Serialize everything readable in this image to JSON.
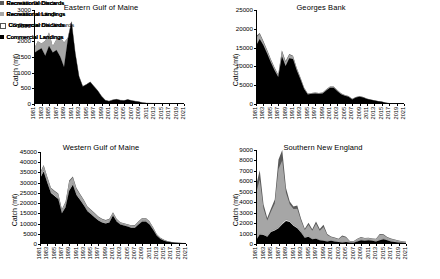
{
  "figure": {
    "ylabel": "Catch (mt)",
    "colors": {
      "recreational_discards": "#595959",
      "recreational_landings": "#a6a6a6",
      "commercial_discards": "#ffffff",
      "commercial_landings": "#000000"
    }
  },
  "chart_data": [
    {
      "id": "eastern-gulf-of-maine",
      "type": "area",
      "title": "Eastern Gulf of Maine",
      "xlabel": "",
      "ylabel": "Catch (mt)",
      "ylim": [
        0,
        3000
      ],
      "yticks": [
        0,
        500,
        1000,
        1500,
        2000,
        2500,
        3000
      ],
      "xlim": [
        1981,
        2021
      ],
      "xticks": [
        1981,
        1983,
        1985,
        1987,
        1989,
        1991,
        1993,
        1995,
        1997,
        1999,
        2001,
        2003,
        2005,
        2007,
        2009,
        2011,
        2013,
        2015,
        2017,
        2019,
        2021
      ],
      "grid": false,
      "legend_position": "right",
      "stacked": true,
      "x": [
        1981,
        1982,
        1983,
        1984,
        1985,
        1986,
        1987,
        1988,
        1989,
        1990,
        1991,
        1992,
        1993,
        1994,
        1995,
        1996,
        1997,
        1998,
        1999,
        2000,
        2001,
        2002,
        2003,
        2004,
        2005,
        2006,
        2007,
        2008,
        2009,
        2010,
        2011,
        2012,
        2013,
        2014,
        2015,
        2016,
        2017,
        2018,
        2019,
        2020,
        2021
      ],
      "series": [
        {
          "name": "Commercial Landings",
          "values": [
            1630,
            1710,
            1780,
            1540,
            1850,
            1640,
            1720,
            1510,
            1180,
            2050,
            2620,
            1620,
            880,
            560,
            620,
            700,
            560,
            420,
            250,
            120,
            90,
            130,
            150,
            120,
            110,
            140,
            110,
            90,
            70,
            40,
            30,
            25,
            20,
            18,
            15,
            12,
            10,
            8,
            6,
            5,
            4
          ]
        },
        {
          "name": "Commercial Discards",
          "values": [
            0,
            0,
            0,
            0,
            0,
            0,
            0,
            0,
            0,
            0,
            0,
            0,
            0,
            0,
            0,
            0,
            0,
            0,
            0,
            0,
            0,
            0,
            0,
            0,
            0,
            0,
            0,
            0,
            0,
            0,
            0,
            0,
            0,
            0,
            0,
            0,
            0,
            0,
            0,
            0,
            0
          ]
        },
        {
          "name": "Recreational Landings",
          "values": [
            130,
            290,
            150,
            480,
            430,
            200,
            350,
            630,
            780,
            60,
            20,
            15,
            10,
            10,
            10,
            10,
            10,
            8,
            6,
            5,
            5,
            5,
            5,
            5,
            5,
            5,
            5,
            5,
            5,
            4,
            3,
            3,
            2,
            2,
            2,
            2,
            2,
            2,
            2,
            2,
            2
          ]
        },
        {
          "name": "Recreational Discards",
          "values": [
            0,
            0,
            0,
            0,
            0,
            0,
            0,
            0,
            0,
            0,
            0,
            0,
            0,
            0,
            0,
            0,
            0,
            0,
            0,
            0,
            0,
            0,
            0,
            0,
            0,
            0,
            0,
            0,
            0,
            0,
            0,
            0,
            0,
            0,
            0,
            0,
            0,
            0,
            0,
            0,
            0
          ]
        }
      ],
      "legend": [
        "Recreational Discards",
        "Recreational Landings",
        "Commercial Discards",
        "Commercial Landings"
      ]
    },
    {
      "id": "georges-bank",
      "type": "area",
      "title": "Georges Bank",
      "xlabel": "",
      "ylabel": "Catch (mt)",
      "ylim": [
        0,
        25000
      ],
      "yticks": [
        0,
        5000,
        10000,
        15000,
        20000,
        25000
      ],
      "xlim": [
        1981,
        2021
      ],
      "xticks": [
        1981,
        1983,
        1985,
        1987,
        1989,
        1991,
        1993,
        1995,
        1997,
        1999,
        2001,
        2003,
        2005,
        2007,
        2009,
        2011,
        2013,
        2015,
        2017,
        2019,
        2021
      ],
      "grid": false,
      "legend_position": "right",
      "stacked": true,
      "x": [
        1981,
        1982,
        1983,
        1984,
        1985,
        1986,
        1987,
        1988,
        1989,
        1990,
        1991,
        1992,
        1993,
        1994,
        1995,
        1996,
        1997,
        1998,
        1999,
        2000,
        2001,
        2002,
        2003,
        2004,
        2005,
        2006,
        2007,
        2008,
        2009,
        2010,
        2011,
        2012,
        2013,
        2014,
        2015,
        2016,
        2017,
        2018,
        2019,
        2020,
        2021
      ],
      "series": [
        {
          "name": "US Commercial Discards",
          "values": [
            15500,
            17300,
            15600,
            13400,
            11100,
            9000,
            7200,
            12700,
            10100,
            12200,
            12000,
            9000,
            6600,
            4000,
            2500,
            2700,
            2800,
            2700,
            2800,
            3600,
            4300,
            4300,
            3400,
            2600,
            2200,
            1900,
            1200,
            1700,
            1900,
            1700,
            1300,
            1100,
            900,
            700,
            600,
            350,
            200,
            150,
            120,
            100,
            90
          ]
        },
        {
          "name": "Canadian Landings",
          "values": [
            2100,
            1300,
            900,
            800,
            700,
            600,
            500,
            1300,
            1100,
            900,
            700,
            500,
            400,
            300,
            250,
            200,
            200,
            200,
            200,
            250,
            300,
            300,
            250,
            200,
            180,
            160,
            140,
            150,
            160,
            150,
            120,
            100,
            80,
            70,
            60,
            40,
            30,
            25,
            20,
            15,
            12
          ]
        },
        {
          "name": "Canadian Discards",
          "values": [
            400,
            300,
            250,
            200,
            180,
            150,
            120,
            300,
            250,
            200,
            150,
            120,
            100,
            80,
            60,
            50,
            50,
            50,
            50,
            60,
            70,
            70,
            60,
            50,
            45,
            40,
            35,
            35,
            35,
            30,
            25,
            20,
            18,
            15,
            12,
            10,
            8,
            6,
            5,
            4,
            3
          ]
        }
      ],
      "legend": [
        "Canadian Discards",
        "Canadian Landings",
        "US Commercial Discards"
      ]
    },
    {
      "id": "western-gulf-of-maine",
      "type": "area",
      "title": "Western Gulf of Maine",
      "xlabel": "",
      "ylabel": "Catch (mt)",
      "ylim": [
        0,
        45000
      ],
      "yticks": [
        0,
        5000,
        10000,
        15000,
        20000,
        25000,
        30000,
        35000,
        40000,
        45000
      ],
      "xlim": [
        1981,
        2021
      ],
      "xticks": [
        1981,
        1983,
        1985,
        1987,
        1989,
        1991,
        1993,
        1995,
        1997,
        1999,
        2001,
        2003,
        2005,
        2007,
        2009,
        2011,
        2013,
        2015,
        2017,
        2019,
        2021
      ],
      "grid": false,
      "legend_position": "right",
      "stacked": true,
      "x": [
        1981,
        1982,
        1983,
        1984,
        1985,
        1986,
        1987,
        1988,
        1989,
        1990,
        1991,
        1992,
        1993,
        1994,
        1995,
        1996,
        1997,
        1998,
        1999,
        2000,
        2001,
        2002,
        2003,
        2004,
        2005,
        2006,
        2007,
        2008,
        2009,
        2010,
        2011,
        2012,
        2013,
        2014,
        2015,
        2016,
        2017,
        2018,
        2019,
        2020,
        2021
      ],
      "series": [
        {
          "name": "Commercial Landings",
          "values": [
            32000,
            35500,
            30000,
            25000,
            23500,
            22000,
            15000,
            18000,
            26000,
            29000,
            24000,
            21500,
            19000,
            16000,
            14500,
            13000,
            11500,
            10500,
            10000,
            10500,
            14000,
            11000,
            9500,
            9000,
            8500,
            8000,
            8000,
            9500,
            11000,
            11000,
            9500,
            7000,
            4000,
            2500,
            1600,
            1100,
            800,
            600,
            450,
            350,
            280
          ]
        },
        {
          "name": "Commercial Discards",
          "values": [
            500,
            600,
            500,
            450,
            400,
            400,
            300,
            350,
            450,
            500,
            450,
            400,
            350,
            300,
            300,
            280,
            250,
            230,
            220,
            230,
            300,
            250,
            220,
            200,
            200,
            190,
            190,
            220,
            250,
            250,
            220,
            180,
            120,
            90,
            70,
            50,
            40,
            30,
            25,
            20,
            15
          ]
        },
        {
          "name": "Recreational Landings",
          "values": [
            2000,
            2200,
            2000,
            1800,
            1800,
            2000,
            1500,
            2000,
            4000,
            3000,
            2500,
            2200,
            2000,
            1800,
            1700,
            1600,
            1500,
            1400,
            1300,
            1400,
            1000,
            900,
            800,
            800,
            800,
            800,
            900,
            1200,
            1300,
            1300,
            1200,
            900,
            600,
            400,
            300,
            200,
            150,
            120,
            90,
            70,
            55
          ]
        },
        {
          "name": "Recreational Discards",
          "values": [
            300,
            400,
            350,
            300,
            300,
            350,
            250,
            300,
            600,
            500,
            400,
            350,
            300,
            280,
            260,
            250,
            230,
            210,
            200,
            210,
            180,
            160,
            150,
            150,
            150,
            150,
            160,
            200,
            220,
            220,
            200,
            160,
            110,
            80,
            60,
            45,
            35,
            25,
            20,
            15,
            12
          ]
        }
      ],
      "legend": [
        "Recreational Discards",
        "Recreational Landings",
        "Commercial Discards",
        "Commercial Landings"
      ]
    },
    {
      "id": "southern-new-england",
      "type": "area",
      "title": "Southern New England",
      "xlabel": "",
      "ylabel": "Catch (mt)",
      "ylim": [
        0,
        9000
      ],
      "yticks": [
        0,
        1000,
        2000,
        3000,
        4000,
        5000,
        6000,
        7000,
        8000,
        9000
      ],
      "xlim": [
        1981,
        2021
      ],
      "xticks": [
        1981,
        1983,
        1985,
        1987,
        1989,
        1991,
        1993,
        1995,
        1997,
        1999,
        2001,
        2003,
        2005,
        2007,
        2009,
        2011,
        2013,
        2015,
        2017,
        2019,
        2021
      ],
      "grid": false,
      "legend_position": "right",
      "stacked": true,
      "x": [
        1981,
        1982,
        1983,
        1984,
        1985,
        1986,
        1987,
        1988,
        1989,
        1990,
        1991,
        1992,
        1993,
        1994,
        1995,
        1996,
        1997,
        1998,
        1999,
        2000,
        2001,
        2002,
        2003,
        2004,
        2005,
        2006,
        2007,
        2008,
        2009,
        2010,
        2011,
        2012,
        2013,
        2014,
        2015,
        2016,
        2017,
        2018,
        2019,
        2020,
        2021
      ],
      "series": [
        {
          "name": "Commercial Landings",
          "values": [
            350,
            900,
            850,
            700,
            1150,
            1300,
            1500,
            1900,
            2200,
            2100,
            1750,
            1500,
            1100,
            600,
            700,
            450,
            500,
            350,
            300,
            250,
            300,
            250,
            200,
            150,
            200,
            150,
            120,
            250,
            350,
            300,
            350,
            300,
            250,
            350,
            450,
            350,
            250,
            200,
            150,
            120,
            100
          ]
        },
        {
          "name": "Commercial Discards",
          "values": [
            30,
            50,
            50,
            40,
            60,
            70,
            80,
            100,
            110,
            100,
            90,
            80,
            60,
            40,
            45,
            30,
            35,
            25,
            20,
            18,
            20,
            18,
            15,
            12,
            15,
            12,
            10,
            18,
            25,
            22,
            25,
            22,
            18,
            25,
            30,
            25,
            18,
            15,
            12,
            10,
            8
          ]
        },
        {
          "name": "Recreational Landings",
          "values": [
            4500,
            5200,
            2500,
            1500,
            1900,
            2500,
            5600,
            6000,
            2600,
            1600,
            1500,
            1800,
            1100,
            700,
            1100,
            800,
            1400,
            900,
            1300,
            600,
            350,
            300,
            250,
            550,
            400,
            100,
            120,
            200,
            250,
            220,
            200,
            180,
            200,
            500,
            380,
            250,
            220,
            180,
            150,
            120,
            100
          ]
        },
        {
          "name": "Recreational Discards",
          "values": [
            700,
            900,
            400,
            250,
            300,
            400,
            900,
            1000,
            450,
            280,
            260,
            300,
            180,
            120,
            180,
            130,
            230,
            150,
            220,
            100,
            60,
            50,
            40,
            90,
            70,
            20,
            20,
            35,
            45,
            38,
            35,
            30,
            35,
            90,
            70,
            45,
            38,
            30,
            25,
            20,
            18
          ]
        }
      ],
      "legend": [
        "Recreational Discards",
        "Recreational Landings",
        "Commercial Discards",
        "Commercial Landings"
      ]
    }
  ]
}
